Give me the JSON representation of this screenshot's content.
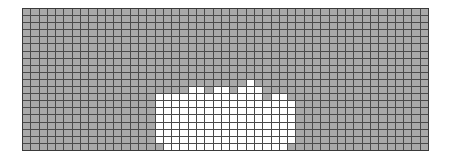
{
  "grid": {
    "cols": 49,
    "rows": 20,
    "colors": {
      "filled": "#a9a9a9",
      "empty": "#ffffff",
      "line": "#4a4a4a"
    },
    "white_cells_by_row": {
      "10": [
        27
      ],
      "11": [
        20,
        21,
        23,
        24,
        26,
        27,
        28
      ],
      "12": [
        16,
        17,
        18,
        19,
        20,
        21,
        22,
        23,
        24,
        25,
        26,
        27,
        28,
        30,
        31
      ],
      "13": [
        16,
        17,
        18,
        19,
        20,
        21,
        22,
        23,
        24,
        25,
        26,
        27,
        28,
        29,
        30,
        31,
        32
      ],
      "14": [
        16,
        17,
        18,
        19,
        20,
        21,
        22,
        23,
        24,
        25,
        26,
        27,
        28,
        29,
        30,
        31,
        32
      ],
      "15": [
        16,
        17,
        18,
        19,
        20,
        21,
        22,
        23,
        24,
        25,
        26,
        27,
        28,
        29,
        30,
        31,
        32
      ],
      "16": [
        16,
        17,
        18,
        19,
        20,
        21,
        22,
        23,
        24,
        25,
        26,
        27,
        28,
        29,
        30,
        31,
        32
      ],
      "17": [
        16,
        17,
        18,
        19,
        20,
        21,
        22,
        23,
        24,
        25,
        26,
        27,
        28,
        29,
        30,
        31,
        32
      ],
      "18": [
        16,
        17,
        18,
        19,
        20,
        21,
        22,
        23,
        24,
        25,
        26,
        27,
        28,
        29,
        30,
        31,
        32
      ],
      "19": [
        17,
        18,
        19,
        20,
        21,
        22,
        23,
        24,
        25,
        26,
        27,
        28,
        29,
        30,
        31
      ]
    }
  }
}
